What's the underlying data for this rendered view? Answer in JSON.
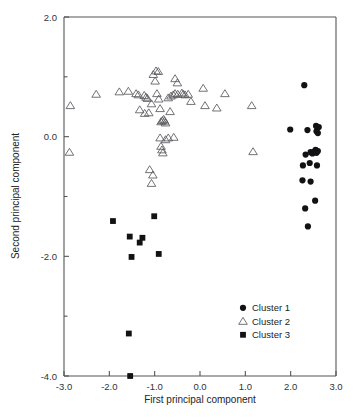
{
  "chart_data": {
    "type": "scatter",
    "title": "",
    "xlabel": "First principal component",
    "ylabel": "Second principal component",
    "xlim": [
      -3.0,
      3.0
    ],
    "ylim": [
      -4.0,
      2.0
    ],
    "xticks": [
      -3.0,
      -2.0,
      -1.0,
      0.0,
      1.0,
      2.0,
      3.0
    ],
    "xticklabels": [
      "-3.0",
      "-2.0",
      "-1.0",
      "0.0",
      "1.0",
      "2.0",
      "3.0"
    ],
    "yticks": [
      -4.0,
      -3.0,
      -2.0,
      -1.0,
      0.0,
      1.0,
      2.0
    ],
    "yticklabels": [
      "-4.0",
      "",
      "-2.0",
      "",
      "0.0",
      "",
      "2.0"
    ],
    "grid": false,
    "legend_position": "lower right",
    "series": [
      {
        "name": "Cluster 1",
        "marker": "filled-circle",
        "color": "#121214",
        "points": [
          [
            2.3,
            0.86
          ],
          [
            1.99,
            0.12
          ],
          [
            2.37,
            0.11
          ],
          [
            2.56,
            0.18
          ],
          [
            2.57,
            0.09
          ],
          [
            2.62,
            0.16
          ],
          [
            2.6,
            0.06
          ],
          [
            2.33,
            -0.3
          ],
          [
            2.44,
            -0.26
          ],
          [
            2.48,
            -0.28
          ],
          [
            2.52,
            -0.25
          ],
          [
            2.55,
            -0.22
          ],
          [
            2.57,
            -0.27
          ],
          [
            2.6,
            -0.24
          ],
          [
            2.42,
            -0.44
          ],
          [
            2.27,
            -0.48
          ],
          [
            2.58,
            -0.48
          ],
          [
            2.26,
            -0.73
          ],
          [
            2.44,
            -0.75
          ],
          [
            2.54,
            -1.07
          ],
          [
            2.32,
            -1.2
          ],
          [
            2.38,
            -1.5
          ]
        ]
      },
      {
        "name": "Cluster 2",
        "marker": "open-triangle",
        "color": "#5a5a5e",
        "points": [
          [
            -2.86,
            0.52
          ],
          [
            -2.88,
            -0.26
          ],
          [
            -2.29,
            0.71
          ],
          [
            -1.78,
            0.75
          ],
          [
            -1.58,
            0.76
          ],
          [
            -1.41,
            0.72
          ],
          [
            -1.36,
            0.7
          ],
          [
            -1.33,
            0.45
          ],
          [
            -1.23,
            0.69
          ],
          [
            -1.19,
            0.66
          ],
          [
            -1.16,
            0.64
          ],
          [
            -1.22,
            0.39
          ],
          [
            -1.13,
            0.4
          ],
          [
            -1.07,
            0.55
          ],
          [
            -1.03,
            1.04
          ],
          [
            -0.99,
            0.93
          ],
          [
            -0.97,
            1.1
          ],
          [
            -0.92,
            1.09
          ],
          [
            -0.95,
            0.72
          ],
          [
            -0.91,
            0.63
          ],
          [
            -0.88,
            0.47
          ],
          [
            -0.86,
            0.25
          ],
          [
            -0.83,
            0.27
          ],
          [
            -0.8,
            0.29
          ],
          [
            -0.78,
            0.26
          ],
          [
            -0.76,
            0.23
          ],
          [
            -0.88,
            -0.02
          ],
          [
            -0.86,
            -0.16
          ],
          [
            -0.84,
            -0.22
          ],
          [
            -0.82,
            -0.27
          ],
          [
            -0.76,
            -0.05
          ],
          [
            -0.7,
            -0.02
          ],
          [
            -0.58,
            -0.01
          ],
          [
            -0.7,
            0.65
          ],
          [
            -0.64,
            0.68
          ],
          [
            -0.59,
            0.7
          ],
          [
            -0.55,
            0.72
          ],
          [
            -0.49,
            0.71
          ],
          [
            -0.66,
            0.42
          ],
          [
            -0.55,
            0.97
          ],
          [
            -0.5,
            0.9
          ],
          [
            -0.4,
            0.73
          ],
          [
            -0.37,
            0.71
          ],
          [
            -0.33,
            0.7
          ],
          [
            -0.26,
            0.71
          ],
          [
            -0.2,
            0.59
          ],
          [
            0.07,
            0.81
          ],
          [
            0.11,
            0.52
          ],
          [
            0.37,
            0.48
          ],
          [
            0.55,
            0.72
          ],
          [
            1.14,
            0.52
          ],
          [
            1.17,
            -0.25
          ],
          [
            -1.11,
            -0.55
          ],
          [
            -1.04,
            -0.64
          ],
          [
            -1.07,
            -0.78
          ]
        ]
      },
      {
        "name": "Cluster 3",
        "marker": "filled-square",
        "color": "#121214",
        "points": [
          [
            -1.92,
            -1.41
          ],
          [
            -1.55,
            -1.67
          ],
          [
            -1.51,
            -2.01
          ],
          [
            -1.33,
            -1.77
          ],
          [
            -1.27,
            -1.69
          ],
          [
            -1.01,
            -1.33
          ],
          [
            -0.91,
            -1.96
          ],
          [
            -1.57,
            -3.29
          ],
          [
            -1.54,
            -4.0
          ]
        ]
      }
    ]
  },
  "legend": {
    "entries": [
      {
        "label": "Cluster 1",
        "marker": "filled-circle"
      },
      {
        "label": "Cluster 2",
        "marker": "open-triangle"
      },
      {
        "label": "Cluster 3",
        "marker": "filled-square"
      }
    ]
  }
}
